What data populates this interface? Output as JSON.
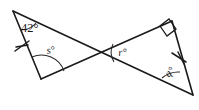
{
  "figure": {
    "background_color": "#ffffff",
    "stroke_color": "#1a1a1a",
    "labels": {
      "known_angle": "42°",
      "angle_s": "s°",
      "angle_r": "r°",
      "angle_q": "q°"
    },
    "markers": {
      "right_angle": "right-angle-square",
      "parallel_tick_left": "single-tick",
      "parallel_tick_right": "single-tick"
    },
    "geometry": {
      "left_triangle": {
        "apex_top_left": [
          13,
          11
        ],
        "vertex_bottom": [
          41,
          79
        ],
        "vertex_right": [
          102,
          52
        ]
      },
      "right_triangle": {
        "vertex_left": [
          97,
          53
        ],
        "apex_top_right": [
          172,
          21
        ],
        "vertex_bottom_right": [
          193,
          95
        ]
      },
      "crossing_point": [
        100,
        52
      ]
    }
  }
}
